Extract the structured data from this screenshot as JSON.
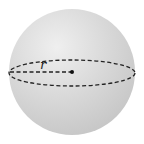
{
  "diagram": {
    "shape": "sphere",
    "radius_label": "r",
    "colors": {
      "sphere_fill": "#d6d6d6",
      "sphere_highlight": "#efefef",
      "sphere_shadow": "#c4c4c4",
      "dash_stroke": "#222222",
      "center_dot": "#111111"
    },
    "geometry": {
      "center": [
        72,
        72
      ],
      "radius": 63,
      "equator_rx": 63,
      "equator_ry": 13
    }
  }
}
